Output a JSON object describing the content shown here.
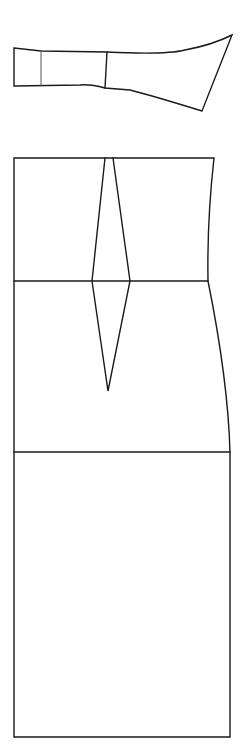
{
  "diagram": {
    "title": "",
    "type": "sewing-pattern",
    "background": "#ffffff",
    "line_color": "#1a1a1a",
    "pieces": [
      {
        "name": "sleeve-or-strap-piece",
        "labels": []
      },
      {
        "name": "skirt-bodice-panel",
        "labels": [],
        "features": [
          "top-edge",
          "waist-line",
          "hip-line",
          "hem",
          "diamond-dart"
        ]
      }
    ]
  }
}
